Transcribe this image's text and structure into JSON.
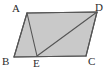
{
  "figure": {
    "kind": "geometry-diagram",
    "width": 108,
    "height": 73,
    "colors": {
      "background": "#ffffff",
      "fill": "#c9c9c9",
      "stroke": "#555555",
      "label": "#2b2b2b"
    },
    "style": {
      "stroke_width": 1.1,
      "label_font_size": 11
    }
  },
  "points": {
    "A": {
      "label": "A",
      "x": 27,
      "y": 13,
      "label_x": 12,
      "label_y": 3
    },
    "B": {
      "label": "B",
      "x": 14,
      "y": 57,
      "label_x": 2,
      "label_y": 56
    },
    "C": {
      "label": "C",
      "x": 86,
      "y": 56,
      "label_x": 88,
      "label_y": 56
    },
    "D": {
      "label": "D",
      "x": 97,
      "y": 12,
      "label_x": 95,
      "label_y": 2
    },
    "E": {
      "label": "E",
      "x": 37,
      "y": 56,
      "label_x": 33,
      "label_y": 58
    }
  },
  "shapes": {
    "parallelogram": {
      "name": "ABCD",
      "vertices": "A,B,C,D",
      "polygon_points": "27,13 14,57 86,56 97,12"
    }
  },
  "segments": [
    {
      "name": "AB",
      "from": "A",
      "to": "B",
      "x1": 27,
      "y1": 13,
      "x2": 14,
      "y2": 57
    },
    {
      "name": "BC",
      "from": "B",
      "to": "C",
      "x1": 14,
      "y1": 57,
      "x2": 86,
      "y2": 56
    },
    {
      "name": "CD",
      "from": "C",
      "to": "D",
      "x1": 86,
      "y1": 56,
      "x2": 97,
      "y2": 12
    },
    {
      "name": "DA",
      "from": "D",
      "to": "A",
      "x1": 97,
      "y1": 12,
      "x2": 27,
      "y2": 13
    },
    {
      "name": "AE",
      "from": "A",
      "to": "E",
      "x1": 27,
      "y1": 13,
      "x2": 37,
      "y2": 56
    },
    {
      "name": "ED",
      "from": "E",
      "to": "D",
      "x1": 37,
      "y1": 56,
      "x2": 97,
      "y2": 12
    }
  ]
}
